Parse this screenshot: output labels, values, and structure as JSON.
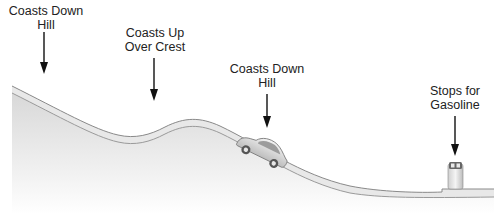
{
  "diagram": {
    "colors": {
      "ground_top": "#d9d9d9",
      "ground_bottom": "#ffffff",
      "road_fill": "#e6e6e6",
      "road_edge": "#8a8a8a",
      "arrow": "#111111",
      "text": "#222222"
    },
    "labels": [
      {
        "line1": "Coasts Down",
        "line2": "Hill",
        "x": 46,
        "y": 4
      },
      {
        "line1": "Coasts Up",
        "line2": "Over Crest",
        "x": 155,
        "y": 26
      },
      {
        "line1": "Coasts Down",
        "line2": "Hill",
        "x": 267,
        "y": 62
      },
      {
        "line1": "Stops for",
        "line2": "Gasoline",
        "x": 455,
        "y": 84
      }
    ],
    "objects": [
      {
        "type": "car",
        "name": "coasting-car"
      },
      {
        "type": "gas-pump",
        "name": "gas-pump"
      }
    ]
  }
}
